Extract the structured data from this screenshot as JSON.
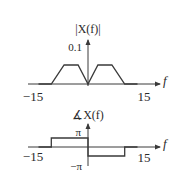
{
  "chart_data": [
    {
      "type": "line",
      "title": "|X(f)|",
      "xlabel": "f",
      "ylabel": "|X(f)|",
      "xlim": [
        -15,
        15
      ],
      "ylim": [
        0,
        0.1
      ],
      "x_tick_labels": [
        "-15",
        "15"
      ],
      "y_tick_labels": [
        "0.1"
      ],
      "grid": false,
      "series": [
        {
          "name": "magnitude",
          "x": [
            -15,
            -10,
            -6.5,
            -2.7,
            0,
            2.7,
            6.5,
            10,
            15
          ],
          "y": [
            0,
            0,
            0.1,
            0.1,
            0,
            0.1,
            0.1,
            0,
            0
          ]
        }
      ]
    },
    {
      "type": "line",
      "title": "∡X(f)",
      "xlabel": "f",
      "ylabel": "∡X(f)",
      "xlim": [
        -15,
        15
      ],
      "ylim": [
        -3.14159,
        3.14159
      ],
      "x_tick_labels": [
        "-15",
        "15"
      ],
      "y_tick_labels": [
        "π",
        "−π"
      ],
      "grid": false,
      "series": [
        {
          "name": "phase",
          "x": [
            -15,
            -10,
            -10,
            0,
            0,
            10,
            10,
            15
          ],
          "y": [
            0,
            0,
            3.14159,
            3.14159,
            -3.14159,
            -3.14159,
            0,
            0
          ]
        }
      ]
    }
  ],
  "labels": {
    "mag_title": "|X(f)|",
    "mag_ytick": "0.1",
    "mag_xmin": "−15",
    "mag_xmax": "15",
    "mag_axis": "f",
    "phase_title": "∡X(f)",
    "phase_ytick_pos": "π",
    "phase_ytick_neg": "−π",
    "phase_xmin": "−15",
    "phase_xmax": "15",
    "phase_axis": "f"
  }
}
